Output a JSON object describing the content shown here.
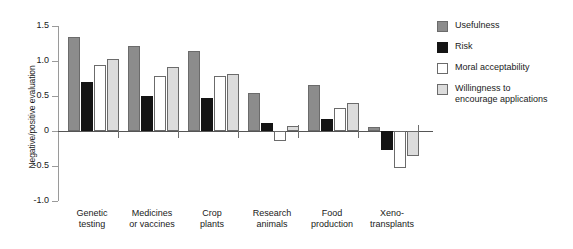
{
  "chart_data": {
    "type": "bar",
    "title": "",
    "xlabel": "",
    "ylabel": "Negative/positive evaluation",
    "ylim": [
      -1.0,
      1.5
    ],
    "yticks": [
      "1.5",
      "1.0",
      "0.5",
      "0",
      "-0.5",
      "-1.0"
    ],
    "ytick_values": [
      1.5,
      1.0,
      0.5,
      0,
      -0.5,
      -1.0
    ],
    "grid": false,
    "legend_position": "right",
    "categories": [
      "Genetic\ntesting",
      "Medicines\nor vaccines",
      "Crop\nplants",
      "Research\nanimals",
      "Food\nproduction",
      "Xeno-\ntransplants"
    ],
    "series": [
      {
        "name": "Usefulness",
        "color": "#8c8c8c",
        "values": [
          1.34,
          1.22,
          1.14,
          0.54,
          0.66,
          0.06
        ]
      },
      {
        "name": "Risk",
        "color": "#141414",
        "values": [
          0.7,
          0.5,
          0.47,
          0.11,
          0.17,
          -0.27
        ]
      },
      {
        "name": "Moral acceptability",
        "color": "#ffffff",
        "values": [
          0.94,
          0.79,
          0.78,
          -0.14,
          0.33,
          -0.53
        ]
      },
      {
        "name": "Willingness to\nencourage applications",
        "color": "#dcdcdc",
        "values": [
          1.03,
          0.92,
          0.81,
          0.07,
          0.4,
          -0.35
        ]
      }
    ]
  },
  "legend": {
    "items": [
      {
        "label": "Usefulness"
      },
      {
        "label": "Risk"
      },
      {
        "label": "Moral acceptability"
      },
      {
        "label": "Willingness to\nencourage applications"
      }
    ]
  }
}
